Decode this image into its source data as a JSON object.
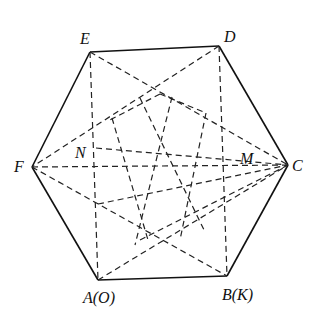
{
  "figure": {
    "type": "hexagon-with-dashed-diagonals",
    "vertices": {
      "E": {
        "label": "E",
        "x": 90,
        "y": 52
      },
      "D": {
        "label": "D",
        "x": 219,
        "y": 46
      },
      "C": {
        "label": "C",
        "x": 288,
        "y": 165
      },
      "B": {
        "label": "B(K)",
        "x": 227,
        "y": 276
      },
      "A": {
        "label": "A(O)",
        "x": 98,
        "y": 280
      },
      "F": {
        "label": "F",
        "x": 32,
        "y": 167
      }
    },
    "points": {
      "N": {
        "label": "N",
        "x": 96,
        "y": 146
      },
      "M": {
        "label": "M",
        "x": 222,
        "y": 150
      }
    },
    "labels": {
      "E": "E",
      "D": "D",
      "C": "C",
      "B": "B(K)",
      "A": "A(O)",
      "F": "F",
      "N": "N",
      "M": "M"
    },
    "stroke_color": "#111111"
  }
}
